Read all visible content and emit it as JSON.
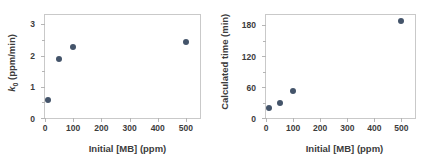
{
  "figure": {
    "background": "#ffffff",
    "marker_color": "#44546a",
    "axis_color": "#c9c9c9",
    "text_color": "#3c3c3c"
  },
  "chart_data": [
    {
      "type": "scatter",
      "title": "",
      "xlabel": "Initial [MB] (ppm)",
      "ylabel": "k₀ (ppm/min)",
      "ylabel_parts": {
        "symbol": "k",
        "subscript": "0",
        "units": " (ppm/min)"
      },
      "xlim": [
        0,
        550
      ],
      "ylim": [
        0,
        3.3
      ],
      "xticks": [
        0,
        100,
        200,
        300,
        400,
        500
      ],
      "xticklabels": [
        "0",
        "100",
        "200",
        "300",
        "400",
        "500"
      ],
      "yticks": [
        0,
        1,
        2,
        3
      ],
      "yticklabels": [
        "0",
        "1",
        "2",
        "3"
      ],
      "yminorticks": [
        0.5,
        1.5,
        2.5
      ],
      "grid": false,
      "legend": "none",
      "x": [
        10,
        50,
        100,
        500
      ],
      "y": [
        0.58,
        1.9,
        2.26,
        2.43
      ]
    },
    {
      "type": "scatter",
      "title": "",
      "xlabel": "Initial [MB] (ppm)",
      "ylabel": "Calculated time (min)",
      "xlim": [
        0,
        550
      ],
      "ylim": [
        0,
        200
      ],
      "xticks": [
        0,
        100,
        200,
        300,
        400,
        500
      ],
      "xticklabels": [
        "0",
        "100",
        "200",
        "300",
        "400",
        "500"
      ],
      "yticks": [
        0,
        60,
        120,
        180
      ],
      "yticklabels": [
        "0",
        "60",
        "120",
        "180"
      ],
      "yminorticks": [
        30,
        90,
        150
      ],
      "grid": false,
      "legend": "none",
      "x": [
        10,
        50,
        100,
        500
      ],
      "y": [
        20,
        30,
        53,
        188
      ]
    }
  ]
}
